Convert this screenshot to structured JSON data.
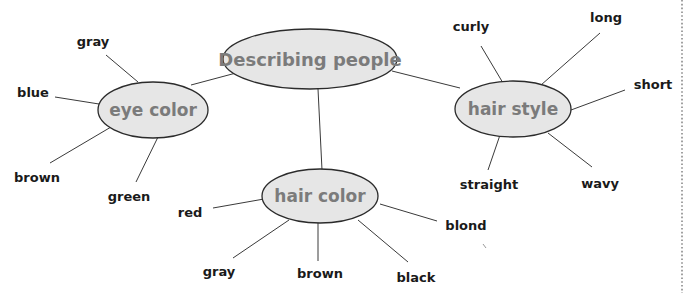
{
  "diagram": {
    "title": "Describing people",
    "colors": {
      "node_fill": "#e6e6e6",
      "node_stroke": "#2b2b2b",
      "node_text": "#7b7b7b",
      "leaf_text": "#1a1a1a",
      "edge": "#3a3a3a"
    },
    "central": {
      "label": "Describing people"
    },
    "branches": [
      {
        "label": "eye color",
        "leaves": [
          "gray",
          "blue",
          "brown",
          "green"
        ]
      },
      {
        "label": "hair color",
        "leaves": [
          "red",
          "gray",
          "brown",
          "black",
          "blond"
        ]
      },
      {
        "label": "hair style",
        "leaves": [
          "curly",
          "long",
          "short",
          "straight",
          "wavy"
        ]
      }
    ]
  }
}
